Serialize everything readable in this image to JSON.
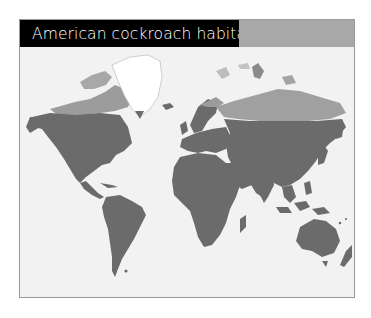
{
  "title": "American cockroach habitats",
  "colors": {
    "title_bg": "#000000",
    "title_text": "#ffffff",
    "accent_bar": "#a8a8a8",
    "ocean": "#f2f2f2",
    "habitat_land": "#6b6b6b",
    "non_habitat_land": "#b8b8b8",
    "ice": "#ffffff"
  },
  "map": {
    "projection": "world",
    "legend_meaning": {
      "dark_gray": "habitat range",
      "light_gray": "outside range (cold northern regions)",
      "white": "ice cap (Greenland)"
    }
  }
}
